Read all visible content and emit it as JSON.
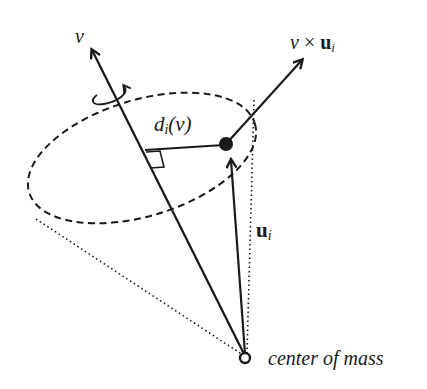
{
  "diagram": {
    "type": "geometric-vector-diagram",
    "labels": {
      "v": "v",
      "cross_main": "v",
      "cross_op": " × ",
      "cross_vec": "u",
      "cross_sub": "i",
      "distance_main": "d",
      "distance_sub": "i",
      "distance_arg": "(v)",
      "u_vec": "u",
      "u_sub": "i",
      "center": "center of mass"
    },
    "elements": [
      {
        "name": "v-axis-arrow",
        "from": "center of mass",
        "to": "v"
      },
      {
        "name": "cross-product-arrow",
        "from": "point",
        "to": "v × u_i"
      },
      {
        "name": "u-i-arrow",
        "from": "center of mass",
        "to": "point"
      },
      {
        "name": "rotation-ellipse",
        "style": "dashed"
      },
      {
        "name": "cone-edges",
        "style": "dotted"
      },
      {
        "name": "perpendicular-distance",
        "label": "d_i(v)"
      },
      {
        "name": "rotation-indicator",
        "style": "curved arrow"
      }
    ],
    "colors": {
      "stroke": "#1a1a1a",
      "background": "#ffffff"
    }
  }
}
